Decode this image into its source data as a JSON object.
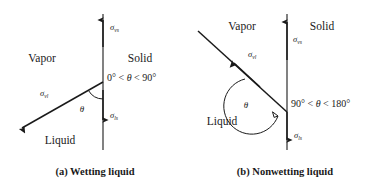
{
  "figure": {
    "type": "physics-diagram",
    "background_color": "#ffffff",
    "line_color": "#1a1a1a"
  },
  "panels": [
    {
      "id": "a",
      "caption": "(a)  Wetting liquid",
      "caption_marker": "(a)",
      "caption_text": "Wetting liquid",
      "phase_labels": {
        "vapor": "Vapor",
        "solid": "Solid",
        "liquid": "Liquid"
      },
      "angle_range": {
        "full": "0° < θ < 90°",
        "lower": "0°",
        "symbol": "θ",
        "upper": "90°",
        "relation": "<"
      },
      "theta_symbol": "θ",
      "vectors": [
        {
          "name": "sigma-vs",
          "base": "σ",
          "subscript": "vs",
          "label": "σvs",
          "direction": "up",
          "description": "vapor-solid surface tension acting upward along the solid surface"
        },
        {
          "name": "sigma-ls",
          "base": "σ",
          "subscript": "ls",
          "label": "σls",
          "direction": "down",
          "description": "liquid-solid surface tension acting downward along the solid surface"
        },
        {
          "name": "sigma-vl",
          "base": "σ",
          "subscript": "vl",
          "label": "σvl",
          "direction": "down-left",
          "description": "vapor-liquid surface tension acting along the liquid surface"
        }
      ]
    },
    {
      "id": "b",
      "caption": "(b)  Nonwetting liquid",
      "caption_marker": "(b)",
      "caption_text": "Nonwetting liquid",
      "phase_labels": {
        "vapor": "Vapor",
        "solid": "Solid",
        "liquid": "Liquid"
      },
      "angle_range": {
        "full": "90° < θ < 180°",
        "lower": "90°",
        "symbol": "θ",
        "upper": "180°",
        "relation": "<"
      },
      "theta_symbol": "θ",
      "vectors": [
        {
          "name": "sigma-vs",
          "base": "σ",
          "subscript": "vs",
          "label": "σvs",
          "direction": "up",
          "description": "vapor-solid surface tension acting upward along the solid surface"
        },
        {
          "name": "sigma-ls",
          "base": "σ",
          "subscript": "ls",
          "label": "σls",
          "direction": "down",
          "description": "liquid-solid surface tension acting downward along the solid surface"
        },
        {
          "name": "sigma-vl",
          "base": "σ",
          "subscript": "vl",
          "label": "σvl",
          "direction": "up-left",
          "description": "vapor-liquid surface tension acting along the liquid surface"
        }
      ]
    }
  ]
}
